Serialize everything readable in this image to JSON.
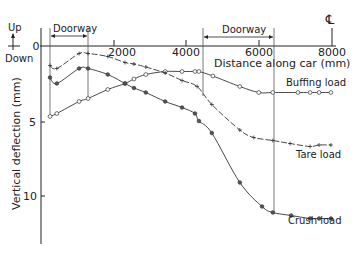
{
  "chart_data": {
    "type": "line",
    "title": "",
    "xlabel": "Distance along car (mm)",
    "ylabel": "Vertical deflection (mm)",
    "xlim": [
      0,
      8000
    ],
    "ylim": [
      -1,
      13
    ],
    "y_inverted": true,
    "grid": false,
    "x_ticks": [
      0,
      2000,
      4000,
      6000,
      8000
    ],
    "x_tick_labels": [
      "0",
      "2000",
      "4000",
      "6000",
      "8000"
    ],
    "y_ticks": [
      0,
      5,
      10
    ],
    "y_tick_labels": [
      "0",
      "5",
      "10"
    ],
    "annotations": {
      "up_label": "Up",
      "down_label": "Down",
      "centerline_symbol": "℄",
      "doorways": [
        {
          "label": "Doorway",
          "x_start": 140,
          "x_end": 1200
        },
        {
          "label": "Doorway",
          "x_start": 4290,
          "x_end": 6350
        }
      ]
    },
    "series": [
      {
        "name": "Buffing load",
        "marker": "open-circle",
        "x": [
          140,
          330,
          950,
          1200,
          1750,
          2230,
          2480,
          2810,
          3350,
          3820,
          4180,
          4290,
          4680,
          5430,
          5960,
          6350,
          7050,
          7390,
          7640,
          7970
        ],
        "y": [
          4.7,
          4.5,
          3.7,
          3.5,
          2.9,
          2.5,
          2.2,
          1.9,
          1.7,
          1.7,
          1.7,
          1.7,
          2.0,
          2.7,
          3.1,
          3.1,
          3.1,
          3.1,
          3.1,
          3.1
        ]
      },
      {
        "name": "Tare load",
        "marker": "plus",
        "x": [
          140,
          330,
          950,
          1200,
          1750,
          2230,
          2480,
          2810,
          3350,
          3820,
          4240,
          4650,
          5430,
          5820,
          6350,
          6830,
          7390,
          7640,
          7970
        ],
        "y": [
          1.3,
          1.5,
          0.5,
          0.5,
          0.7,
          1.1,
          1.2,
          1.4,
          1.8,
          2.3,
          2.7,
          3.9,
          5.6,
          6.1,
          6.3,
          6.5,
          6.7,
          6.6,
          6.6
        ]
      },
      {
        "name": "Crush load",
        "marker": "filled-circle",
        "x": [
          140,
          330,
          950,
          1200,
          1750,
          2230,
          2480,
          2810,
          3350,
          3820,
          4180,
          4290,
          4650,
          5430,
          6050,
          6350,
          6860,
          7390,
          7640,
          7970
        ],
        "y": [
          2.1,
          2.5,
          1.5,
          1.5,
          1.9,
          2.5,
          2.8,
          3.1,
          3.7,
          4.1,
          4.5,
          5.0,
          5.8,
          9.1,
          10.7,
          11.1,
          11.3,
          11.5,
          11.5,
          11.5
        ]
      }
    ]
  },
  "labels": {
    "buffing": "Buffing load",
    "tare": "Tare load",
    "crush": "Crush load",
    "xlabel": "Distance along car (mm)",
    "ylabel": "Vertical deflection (mm)",
    "up": "Up",
    "down": "Down",
    "doorway1": "Doorway",
    "doorway2": "Doorway",
    "centerline": "℄",
    "x0": "0",
    "x2000": "2000",
    "x4000": "4000",
    "x6000": "6000",
    "x8000": "8000",
    "y0": "0",
    "y5": "5",
    "y10": "10"
  }
}
